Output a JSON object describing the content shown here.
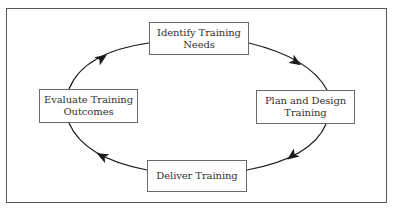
{
  "diagram": {
    "type": "cycle",
    "direction": "clockwise",
    "nodes": [
      {
        "id": "identify",
        "label": "Identify Training\nNeeds",
        "position": "top"
      },
      {
        "id": "plan",
        "label": "Plan and Design\nTraining",
        "position": "right"
      },
      {
        "id": "deliver",
        "label": "Deliver Training",
        "position": "bottom"
      },
      {
        "id": "evaluate",
        "label": "Evaluate Training\nOutcomes",
        "position": "left"
      }
    ],
    "edges": [
      {
        "from": "identify",
        "to": "plan"
      },
      {
        "from": "plan",
        "to": "deliver"
      },
      {
        "from": "deliver",
        "to": "evaluate"
      },
      {
        "from": "evaluate",
        "to": "identify"
      }
    ]
  },
  "colors": {
    "line": "#1a1a1a",
    "box_border": "#6a6a6a",
    "frame_border": "#555555",
    "text": "#333333"
  }
}
